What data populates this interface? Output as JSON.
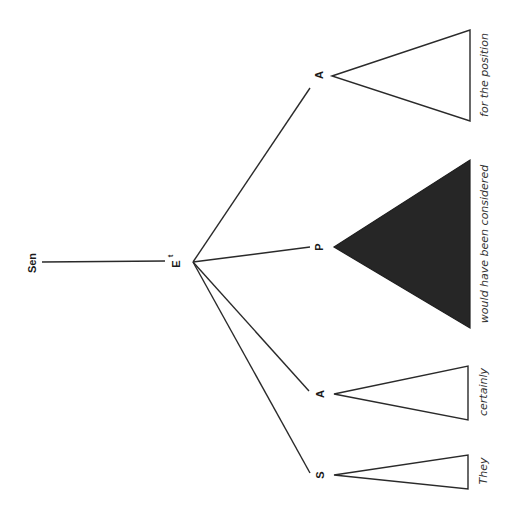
{
  "diagram": {
    "type": "syntax-tree",
    "orientation": "rotated-90-ccw",
    "root": {
      "label": "Sen"
    },
    "head": {
      "label": "E",
      "superscript": "t"
    },
    "children": [
      {
        "label": "A",
        "leaf": "for the position",
        "triangle": "open"
      },
      {
        "label": "P",
        "leaf": "would have been considered",
        "triangle": "filled"
      },
      {
        "label": "A",
        "leaf": "certainly",
        "triangle": "open"
      },
      {
        "label": "S",
        "leaf": "They",
        "triangle": "open"
      }
    ],
    "colors": {
      "line": "#2a2a2a",
      "filled_triangle": "#262626",
      "background": "#ffffff"
    }
  }
}
